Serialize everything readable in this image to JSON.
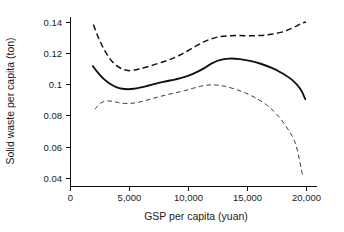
{
  "chart_data": {
    "type": "line",
    "title": "",
    "xlabel": "GSP per capita (yuan)",
    "ylabel": "Solid waste per capita (ton)",
    "xlim": [
      0,
      21000
    ],
    "ylim": [
      0.0335,
      0.1455
    ],
    "grid": false,
    "legend": "none",
    "xticks": [
      0,
      5000,
      10000,
      15000,
      20000
    ],
    "xtick_labels": [
      "0",
      "5,000",
      "10,000",
      "15,000",
      "20,000"
    ],
    "yticks": [
      0.04,
      0.06,
      0.08,
      0.1,
      0.12,
      0.14
    ],
    "ytick_labels": [
      "0.04",
      "0.06",
      "0.08",
      "0.1",
      "0.12",
      "0.14"
    ],
    "series": [
      {
        "name": "Upper confidence bound",
        "style": "dashed",
        "x": [
          1950,
          2400,
          2900,
          3400,
          3900,
          4400,
          4900,
          5400,
          5900,
          6500,
          7200,
          7900,
          8600,
          9300,
          10000,
          10700,
          11400,
          12000,
          12700,
          13500,
          14400,
          15300,
          16200,
          17100,
          18000,
          18900,
          19600,
          20050
        ],
        "y": [
          0.1405,
          0.1315,
          0.1235,
          0.1175,
          0.1135,
          0.1112,
          0.1101,
          0.1104,
          0.1112,
          0.1124,
          0.1142,
          0.1159,
          0.1178,
          0.1202,
          0.1232,
          0.1264,
          0.1292,
          0.1311,
          0.1325,
          0.1331,
          0.1332,
          0.1331,
          0.1333,
          0.1341,
          0.1355,
          0.1382,
          0.1409,
          0.1422
        ]
      },
      {
        "name": "Fitted curve",
        "style": "solid",
        "x": [
          1900,
          2400,
          2900,
          3400,
          3900,
          4400,
          4900,
          5400,
          5900,
          6500,
          7200,
          7900,
          8600,
          9300,
          10000,
          10700,
          11400,
          12000,
          12700,
          13500,
          14400,
          15300,
          16200,
          17100,
          18000,
          18900,
          19600,
          20000
        ],
        "y": [
          0.113,
          0.1081,
          0.1041,
          0.1012,
          0.0992,
          0.0981,
          0.0978,
          0.0981,
          0.0988,
          0.0999,
          0.1013,
          0.1026,
          0.1037,
          0.1049,
          0.1066,
          0.1089,
          0.1117,
          0.1147,
          0.117,
          0.118,
          0.1177,
          0.1165,
          0.1146,
          0.112,
          0.1085,
          0.1038,
          0.0978,
          0.0912
        ]
      },
      {
        "name": "Lower confidence bound",
        "style": "dashed-thin",
        "x": [
          2080,
          2500,
          2900,
          3300,
          3700,
          4100,
          4600,
          5100,
          5600,
          6200,
          6900,
          7600,
          8300,
          9000,
          9700,
          10400,
          11100,
          11800,
          12500,
          13200,
          14000,
          14900,
          15800,
          16700,
          17600,
          18500,
          19200,
          19800
        ],
        "y": [
          0.0845,
          0.0882,
          0.0898,
          0.09,
          0.0896,
          0.0889,
          0.0884,
          0.0884,
          0.0889,
          0.0899,
          0.0914,
          0.0929,
          0.0943,
          0.0955,
          0.0968,
          0.0983,
          0.0998,
          0.1006,
          0.1005,
          0.0996,
          0.0979,
          0.0953,
          0.0919,
          0.0874,
          0.081,
          0.0716,
          0.061,
          0.0398
        ]
      }
    ]
  }
}
